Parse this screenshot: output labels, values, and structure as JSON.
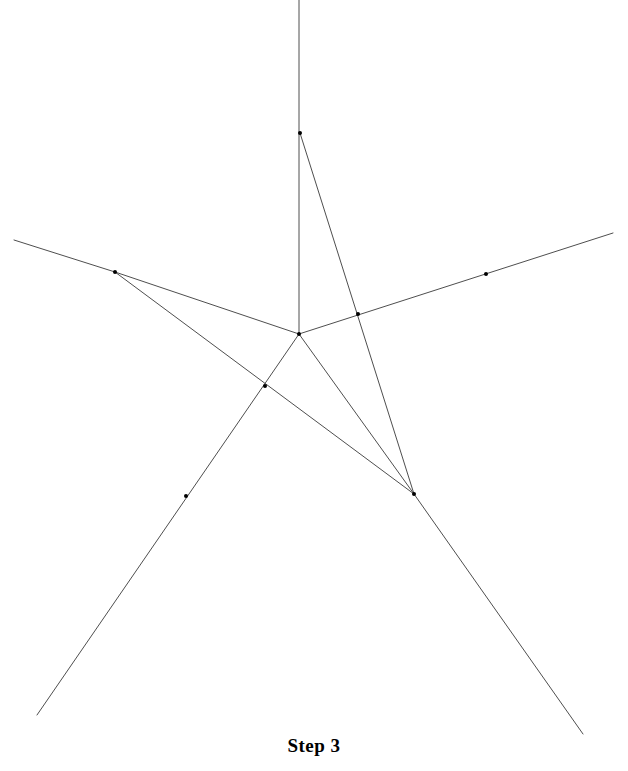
{
  "figure": {
    "caption": "Step 3",
    "canvas": {
      "width": 628,
      "height": 771
    },
    "background_color": "#ffffff",
    "stroke_color": "#3a3a3a",
    "stroke_width": 0.9,
    "vertex_color": "#000000",
    "vertex_radius": 2.0,
    "named_points": {
      "top": {
        "x": 300,
        "y": 133
      },
      "left": {
        "x": 115,
        "y": 272
      },
      "center": {
        "x": 299,
        "y": 334
      },
      "lower_right": {
        "x": 414,
        "y": 494
      },
      "right_mark": {
        "x": 486,
        "y": 274
      },
      "lower_left_mark": {
        "x": 186,
        "y": 496
      }
    },
    "segments": [
      {
        "name": "vertical-ray-top",
        "x1": 299,
        "y1": 0,
        "x2": 299,
        "y2": 334
      },
      {
        "name": "top-to-lower-right",
        "x1": 300,
        "y1": 133,
        "x2": 414,
        "y2": 494
      },
      {
        "name": "left-ray-to-edge",
        "x1": 14,
        "y1": 240,
        "x2": 115,
        "y2": 272
      },
      {
        "name": "left-to-center",
        "x1": 115,
        "y1": 272,
        "x2": 299,
        "y2": 334
      },
      {
        "name": "left-to-lower-right",
        "x1": 115,
        "y1": 272,
        "x2": 414,
        "y2": 494
      },
      {
        "name": "center-to-right-edge",
        "x1": 299,
        "y1": 334,
        "x2": 613,
        "y2": 233
      },
      {
        "name": "center-to-lower-right",
        "x1": 299,
        "y1": 334,
        "x2": 414,
        "y2": 494
      },
      {
        "name": "center-to-lower-left-edge",
        "x1": 299,
        "y1": 334,
        "x2": 37,
        "y2": 715
      },
      {
        "name": "lower-right-to-bottom-edge",
        "x1": 414,
        "y1": 494,
        "x2": 583,
        "y2": 734
      }
    ],
    "vertex_markers": [
      {
        "name": "vertex-top",
        "x": 300,
        "y": 133
      },
      {
        "name": "vertex-left",
        "x": 115,
        "y": 272
      },
      {
        "name": "vertex-center",
        "x": 299,
        "y": 334
      },
      {
        "name": "vertex-lower-right",
        "x": 414,
        "y": 494
      },
      {
        "name": "point-on-right-ray",
        "x": 486,
        "y": 274
      },
      {
        "name": "point-on-lower-left-ray",
        "x": 186,
        "y": 496
      },
      {
        "name": "crossing-left",
        "x": 265,
        "y": 386
      },
      {
        "name": "crossing-right",
        "x": 358,
        "y": 314
      }
    ]
  }
}
